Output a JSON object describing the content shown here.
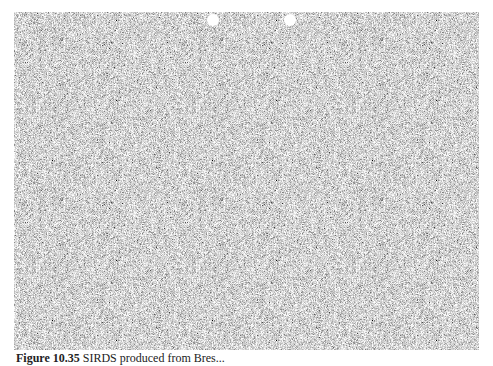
{
  "figure": {
    "type": "SIRDS random-dot stereogram",
    "background_gray": "#9a9a9a",
    "guide_dots": [
      {
        "x": 213,
        "y": 20,
        "color": "#ffffff"
      },
      {
        "x": 290,
        "y": 20,
        "color": "#ffffff"
      }
    ]
  },
  "caption": {
    "label": "Figure 10.35",
    "text": "SIRDS produced from Bres..."
  }
}
